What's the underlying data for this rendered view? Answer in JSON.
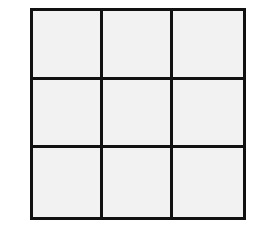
{
  "diagram": {
    "type": "grid",
    "rows": 3,
    "columns": 3,
    "cells": [
      [
        "",
        "",
        ""
      ],
      [
        "",
        "",
        ""
      ],
      [
        "",
        "",
        ""
      ]
    ],
    "colors": {
      "line": "#111111",
      "cell_fill": "#f2f2f2",
      "background": "#ffffff"
    }
  }
}
